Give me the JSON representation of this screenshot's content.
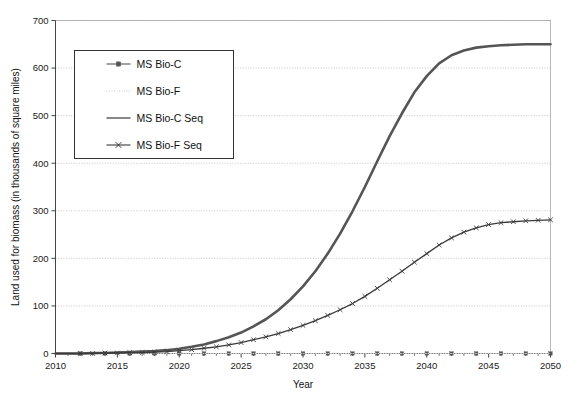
{
  "chart_data": {
    "type": "line",
    "title": "",
    "xlabel": "Year",
    "ylabel": "Land used for biomass (in thousands of square miles)",
    "xlim": [
      2010,
      2050
    ],
    "ylim": [
      0,
      700
    ],
    "ytick_step": 100,
    "xtick_step": 5,
    "xminor_step": 1,
    "grid": true,
    "grid_axis": "y",
    "legend_position": "upper-left-inside",
    "x": [
      2010,
      2011,
      2012,
      2013,
      2014,
      2015,
      2016,
      2017,
      2018,
      2019,
      2020,
      2021,
      2022,
      2023,
      2024,
      2025,
      2026,
      2027,
      2028,
      2029,
      2030,
      2031,
      2032,
      2033,
      2034,
      2035,
      2036,
      2037,
      2038,
      2039,
      2040,
      2041,
      2042,
      2043,
      2044,
      2045,
      2046,
      2047,
      2048,
      2049,
      2050
    ],
    "series": [
      {
        "name": "MS Bio-C",
        "color": "#555555",
        "style": "solid-with-square-markers",
        "marker": "square",
        "values": [
          0,
          0,
          0,
          0,
          0,
          0,
          0,
          0,
          0,
          0,
          0,
          0,
          0,
          0,
          0,
          0,
          0,
          0,
          0,
          0,
          0,
          0,
          0,
          0,
          0,
          0,
          0,
          0,
          0,
          0,
          0,
          0,
          0,
          0,
          0,
          0,
          0,
          0,
          0,
          0,
          0
        ]
      },
      {
        "name": "MS Bio-F",
        "color": "#c9c9c9",
        "style": "dotted-light",
        "marker": "none",
        "values": [
          0,
          0,
          0,
          0,
          0,
          0,
          0,
          0,
          0,
          0,
          0,
          0,
          0,
          0,
          0,
          0,
          0,
          0,
          0,
          0,
          0,
          0,
          0,
          0,
          0,
          0,
          0,
          0,
          0,
          0,
          0,
          0,
          0,
          0,
          0,
          0,
          0,
          0,
          0,
          0,
          0
        ]
      },
      {
        "name": "MS Bio-C Seq",
        "color": "#555555",
        "style": "solid-thick",
        "marker": "none",
        "values": [
          0,
          0,
          0,
          1,
          1,
          2,
          3,
          4,
          5,
          7,
          10,
          14,
          19,
          26,
          34,
          44,
          57,
          72,
          91,
          114,
          141,
          173,
          210,
          252,
          299,
          350,
          404,
          457,
          505,
          549,
          583,
          610,
          627,
          637,
          643,
          646,
          648,
          649,
          650,
          650,
          650
        ]
      },
      {
        "name": "MS Bio-F Seq",
        "color": "#3a3a3a",
        "style": "solid-with-x-markers",
        "marker": "x",
        "values": [
          0,
          0,
          0,
          0,
          1,
          1,
          2,
          2,
          3,
          4,
          6,
          8,
          11,
          14,
          18,
          23,
          29,
          35,
          42,
          50,
          59,
          69,
          80,
          92,
          105,
          120,
          137,
          155,
          173,
          192,
          210,
          228,
          243,
          255,
          264,
          271,
          275,
          277,
          279,
          280,
          281
        ]
      }
    ],
    "ytick_labels": [
      "0",
      "100",
      "200",
      "300",
      "400",
      "500",
      "600",
      "700"
    ],
    "ytick_values": [
      0,
      100,
      200,
      300,
      400,
      500,
      600,
      700
    ],
    "xtick_labels": [
      "2010",
      "2015",
      "2020",
      "2025",
      "2030",
      "2035",
      "2040",
      "2045",
      "2050"
    ],
    "xtick_values": [
      2010,
      2015,
      2020,
      2025,
      2030,
      2035,
      2040,
      2045,
      2050
    ]
  },
  "legend": {
    "entries": [
      {
        "label": "MS Bio-C"
      },
      {
        "label": "MS Bio-F"
      },
      {
        "label": "MS Bio-C Seq"
      },
      {
        "label": "MS Bio-F Seq"
      }
    ]
  },
  "axes": {
    "x_title": "Year",
    "y_title": "Land used for biomass (in thousands of square miles)"
  }
}
